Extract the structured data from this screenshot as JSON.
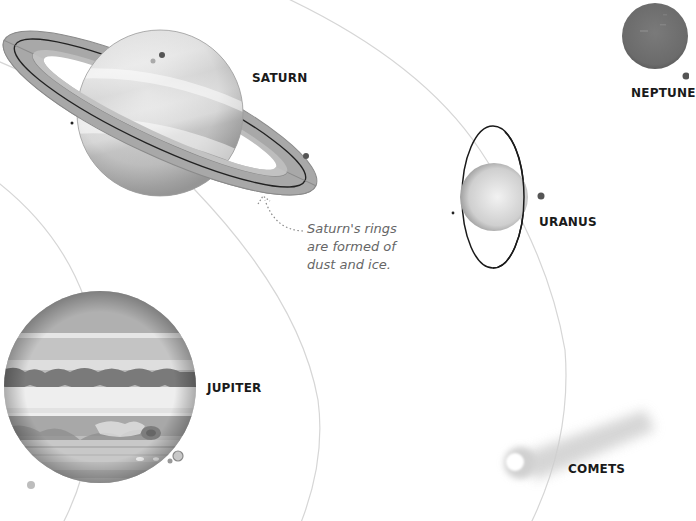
{
  "scene": {
    "background": "#ffffff",
    "orbit_color": "#d4d4d4"
  },
  "planets": {
    "saturn": {
      "label": "SATURN"
    },
    "jupiter": {
      "label": "JUPITER"
    },
    "uranus": {
      "label": "URANUS"
    },
    "neptune": {
      "label": "NEPTUNE"
    }
  },
  "comets": {
    "label": "COMETS"
  },
  "annotation": {
    "saturn_rings": {
      "line1": "Saturn's rings",
      "line2": "are formed of",
      "line3": "dust and ice."
    }
  }
}
